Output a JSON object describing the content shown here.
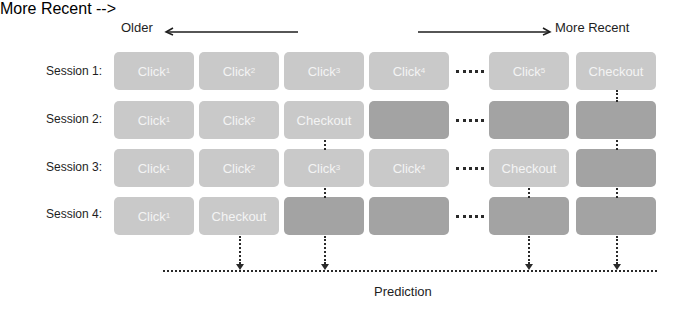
{
  "header": {
    "older_label": "Older",
    "recent_label": "More Recent"
  },
  "rows": [
    {
      "label": "Session 1:",
      "cells": [
        {
          "text": "Click",
          "sup": "1",
          "shade": "light"
        },
        {
          "text": "Click",
          "sup": "2",
          "shade": "light"
        },
        {
          "text": "Click",
          "sup": "3",
          "shade": "light"
        },
        {
          "text": "Click",
          "sup": "4",
          "shade": "light"
        },
        {
          "text": "Click",
          "sup": "5",
          "shade": "light"
        },
        {
          "text": "Checkout",
          "sup": "",
          "shade": "light"
        }
      ]
    },
    {
      "label": "Session 2:",
      "cells": [
        {
          "text": "Click",
          "sup": "1",
          "shade": "light"
        },
        {
          "text": "Click",
          "sup": "2",
          "shade": "light"
        },
        {
          "text": "Checkout",
          "sup": "",
          "shade": "light"
        },
        {
          "text": "",
          "sup": "",
          "shade": "dark"
        },
        {
          "text": "",
          "sup": "",
          "shade": "dark"
        },
        {
          "text": "",
          "sup": "",
          "shade": "dark"
        }
      ]
    },
    {
      "label": "Session 3:",
      "cells": [
        {
          "text": "Click",
          "sup": "1",
          "shade": "light"
        },
        {
          "text": "Click",
          "sup": "2",
          "shade": "light"
        },
        {
          "text": "Click",
          "sup": "3",
          "shade": "light"
        },
        {
          "text": "Click",
          "sup": "4",
          "shade": "light"
        },
        {
          "text": "Checkout",
          "sup": "",
          "shade": "light"
        },
        {
          "text": "",
          "sup": "",
          "shade": "dark"
        }
      ]
    },
    {
      "label": "Session 4:",
      "cells": [
        {
          "text": "Click",
          "sup": "1",
          "shade": "light"
        },
        {
          "text": "Checkout",
          "sup": "",
          "shade": "light"
        },
        {
          "text": "",
          "sup": "",
          "shade": "dark"
        },
        {
          "text": "",
          "sup": "",
          "shade": "dark"
        },
        {
          "text": "",
          "sup": "",
          "shade": "dark"
        },
        {
          "text": "",
          "sup": "",
          "shade": "dark"
        }
      ]
    }
  ],
  "ellipsis": "......",
  "prediction_label": "Prediction",
  "colors": {
    "light_box": "#c9c9c9",
    "dark_box": "#a3a3a3",
    "box_text": "#f4f4f4",
    "line": "#2a2a2a"
  }
}
